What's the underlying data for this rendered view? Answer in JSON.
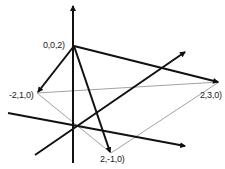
{
  "diagram": {
    "type": "3d-coordinate-axes-with-vectors",
    "origin_px": [
      73,
      125
    ],
    "axes": [
      {
        "name": "z-axis",
        "from": [
          73,
          163
        ],
        "to": [
          73,
          5
        ],
        "arrow": true
      },
      {
        "name": "y-axis",
        "from": [
          35,
          155
        ],
        "to": [
          185,
          52
        ],
        "arrow": true
      },
      {
        "name": "x-axis",
        "from": [
          8,
          113
        ],
        "to": [
          185,
          146
        ],
        "arrow": true
      }
    ],
    "points": [
      {
        "label": "0,0,2)",
        "px": [
          74,
          46
        ],
        "label_pos": [
          43,
          40
        ]
      },
      {
        "label": "-2,1,0)",
        "px": [
          37,
          93
        ],
        "label_pos": [
          9,
          90
        ]
      },
      {
        "label": "2,3,0)",
        "px": [
          219,
          82
        ],
        "label_pos": [
          200,
          90
        ]
      },
      {
        "label": "2,-1,0)",
        "px": [
          111,
          153
        ],
        "label_pos": [
          100,
          154
        ]
      }
    ],
    "vectors": [
      {
        "from": "0,0,2)",
        "to": "-2,1,0)"
      },
      {
        "from": "0,0,2)",
        "to": "2,3,0)"
      },
      {
        "from": "0,0,2)",
        "to": "2,-1,0)"
      }
    ],
    "thin_lines": [
      {
        "from": "-2,1,0)",
        "to": "2,3,0)"
      },
      {
        "from": "-2,1,0)",
        "to": "2,-1,0)"
      },
      {
        "from": "2,-1,0)",
        "to": "2,3,0)"
      }
    ],
    "colors": {
      "thick": "#111111",
      "thin": "#888888",
      "background": "#ffffff"
    }
  }
}
